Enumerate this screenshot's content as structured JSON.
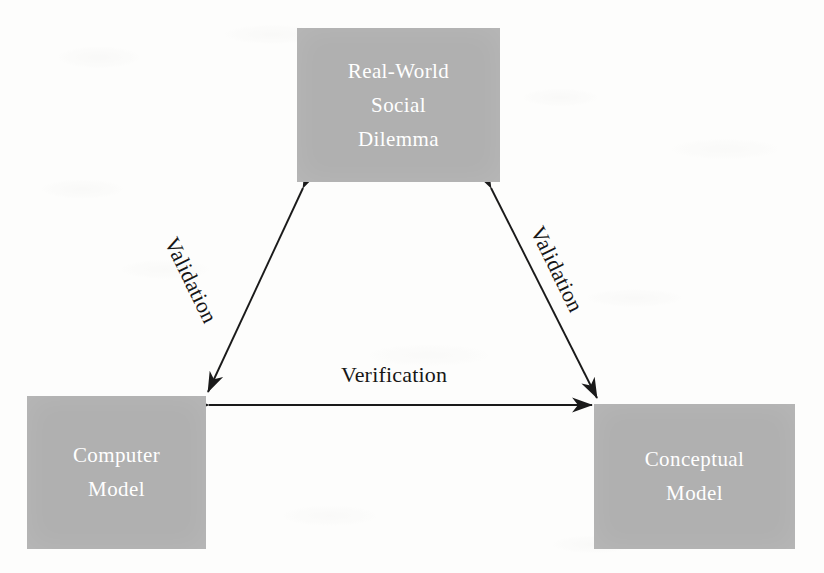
{
  "figure": {
    "type": "triangle-diagram",
    "background_color": "#fdfdfc",
    "box_fill_color": "#b0b0b0",
    "box_text_color": "#ffffff",
    "line_color": "#1a1a1a",
    "label_text_color": "#171717"
  },
  "nodes": {
    "real_world": {
      "name": "Real-World Social Dilemma",
      "line1": "Real-World",
      "line2": "Social",
      "line3": "Dilemma"
    },
    "computer_model": {
      "name": "Computer Model",
      "line1": "Computer",
      "line2": "Model"
    },
    "conceptual_model": {
      "name": "Conceptual Model",
      "line1": "Conceptual",
      "line2": "Model"
    }
  },
  "edges": {
    "left": {
      "label": "Validation",
      "from": "Real-World Social Dilemma",
      "to": "Computer Model",
      "arrowheads": "both"
    },
    "right": {
      "label": "Validation",
      "from": "Real-World Social Dilemma",
      "to": "Conceptual Model",
      "arrowheads": "both"
    },
    "bottom": {
      "label": "Verification",
      "from": "Computer Model",
      "to": "Conceptual Model",
      "arrowheads": "both"
    }
  }
}
